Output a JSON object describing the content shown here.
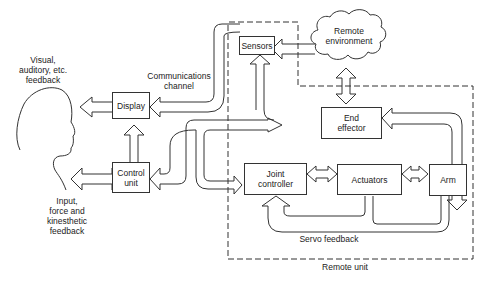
{
  "diagram": {
    "nodes": {
      "sensors": "Sensors",
      "remote_environment": "Remote\nenvironment",
      "display": "Display",
      "control_unit": "Control\nunit",
      "end_effector": "End\neffector",
      "joint_controller": "Joint\ncontroller",
      "actuators": "Actuators",
      "arm": "Arm"
    },
    "labels": {
      "visual_feedback": "Visual,\nauditory, etc.\nfeedback",
      "input_feedback": "Input,\nforce and\nkinesthetic\nfeedback",
      "communications_channel": "Communications\nchannel",
      "servo_feedback": "Servo feedback",
      "remote_unit": "Remote unit"
    },
    "edges": [
      {
        "from": "remote_environment",
        "to": "sensors"
      },
      {
        "from": "remote_environment",
        "to": "end_effector",
        "bidirectional": true
      },
      {
        "from": "sensors",
        "to": "display",
        "via": "communications_channel"
      },
      {
        "from": "display",
        "to": "operator"
      },
      {
        "from": "control_unit",
        "to": "display"
      },
      {
        "from": "operator",
        "to": "control_unit",
        "bidirectional": true
      },
      {
        "from": "control_unit",
        "to": "sensors"
      },
      {
        "from": "control_unit",
        "to": "end_effector"
      },
      {
        "from": "control_unit",
        "to": "joint_controller"
      },
      {
        "from": "end_effector",
        "to": "arm",
        "bidirectional": true
      },
      {
        "from": "joint_controller",
        "to": "actuators",
        "bidirectional": true
      },
      {
        "from": "actuators",
        "to": "arm",
        "bidirectional": true
      },
      {
        "from": "actuators",
        "to": "joint_controller",
        "label": "servo_feedback"
      },
      {
        "from": "arm",
        "to": "joint_controller",
        "label": "servo_feedback"
      }
    ]
  }
}
